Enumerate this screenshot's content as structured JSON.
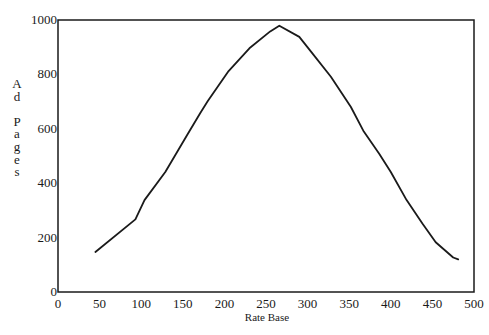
{
  "chart_data": {
    "type": "line",
    "title": "",
    "xlabel": "Rate Base",
    "ylabel": "Ad Pages",
    "xlim": [
      0,
      500
    ],
    "ylim": [
      0,
      1000
    ],
    "x_ticks": [
      0,
      50,
      100,
      150,
      200,
      250,
      300,
      350,
      400,
      450,
      500
    ],
    "y_ticks": [
      0,
      200,
      400,
      600,
      800,
      1000
    ],
    "grid": false,
    "legend": null,
    "series": [
      {
        "name": "Ad Pages",
        "color": "#1a1a1a",
        "x": [
          45,
          93,
          104,
          129,
          155,
          171,
          180,
          205,
          230,
          255,
          266,
          290,
          305,
          328,
          352,
          367,
          386,
          400,
          419,
          438,
          454,
          475,
          481
        ],
        "y": [
          147,
          267,
          338,
          441,
          576,
          658,
          702,
          812,
          896,
          958,
          979,
          938,
          880,
          791,
          680,
          593,
          508,
          441,
          338,
          252,
          183,
          127,
          120
        ]
      }
    ]
  },
  "labels": {
    "xlabel": "Rate Base",
    "ylabel_letters": [
      "A",
      "d",
      "",
      "P",
      "a",
      "g",
      "e",
      "s"
    ]
  }
}
